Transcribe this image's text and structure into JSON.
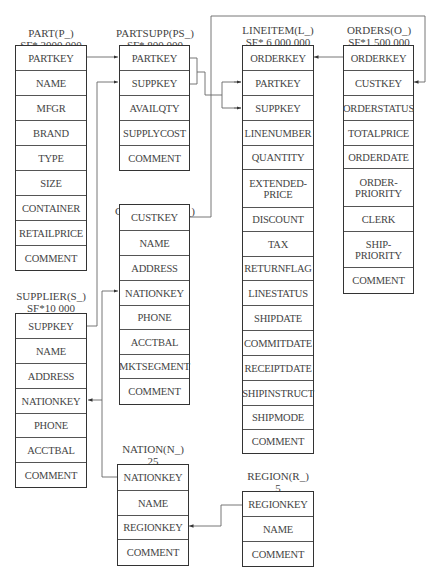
{
  "tables": {
    "part": {
      "name": "PART(P_)",
      "cardinality": "SF* 2000 000",
      "columns": [
        "PARTKEY",
        "NAME",
        "MFGR",
        "BRAND",
        "TYPE",
        "SIZE",
        "CONTAINER",
        "RETAILPRICE",
        "COMMENT"
      ]
    },
    "partsupp": {
      "name": "PARTSUPP(PS_)",
      "cardinality": "SF* 800 000",
      "columns": [
        "PARTKEY",
        "SUPPKEY",
        "AVAILQTY",
        "SUPPLYCOST",
        "COMMENT"
      ]
    },
    "lineitem": {
      "name": "LINEITEM(L_)",
      "cardinality": "SF* 6 000 000",
      "columns": [
        "ORDERKEY",
        "PARTKEY",
        "SUPPKEY",
        "LINENUMBER",
        "QUANTITY",
        "EXTENDED-\nPRICE",
        "DISCOUNT",
        "TAX",
        "RETURNFLAG",
        "LINESTATUS",
        "SHIPDATE",
        "COMMITDATE",
        "RECEIPTDATE",
        "SHIPINSTRUCT",
        "SHIPMODE",
        "COMMENT"
      ]
    },
    "orders": {
      "name": "ORDERS(O_)",
      "cardinality": "SF*1 500 000",
      "columns": [
        "ORDERKEY",
        "CUSTKEY",
        "ORDERSTATUS",
        "TOTALPRICE",
        "ORDERDATE",
        "ORDER-\nPRIORITY",
        "CLERK",
        "SHIP-\nPRIORITY",
        "COMMENT"
      ]
    },
    "customer": {
      "name": "CUSTOMER(C_)",
      "cardinality": "SF*150 000",
      "columns": [
        "CUSTKEY",
        "NAME",
        "ADDRESS",
        "NATIONKEY",
        "PHONE",
        "ACCTBAL",
        "MKTSEGMENT",
        "COMMENT"
      ]
    },
    "supplier": {
      "name": "SUPPLIER(S_)",
      "cardinality": "SF*10 000",
      "columns": [
        "SUPPKEY",
        "NAME",
        "ADDRESS",
        "NATIONKEY",
        "PHONE",
        "ACCTBAL",
        "COMMENT"
      ]
    },
    "nation": {
      "name": "NATION(N_)",
      "cardinality": "25",
      "columns": [
        "NATIONKEY",
        "NAME",
        "REGIONKEY",
        "COMMENT"
      ]
    },
    "region": {
      "name": "REGION(R_)",
      "cardinality": "5",
      "columns": [
        "REGIONKEY",
        "NAME",
        "COMMENT"
      ]
    }
  },
  "relationships": [
    {
      "from": "PART.PARTKEY",
      "to": "PARTSUPP.PARTKEY"
    },
    {
      "from": "SUPPLIER.SUPPKEY",
      "to": "PARTSUPP.SUPPKEY"
    },
    {
      "from": "PARTSUPP.PARTKEY",
      "to": "LINEITEM.PARTKEY"
    },
    {
      "from": "PARTSUPP.SUPPKEY",
      "to": "LINEITEM.SUPPKEY"
    },
    {
      "from": "ORDERS.ORDERKEY",
      "to": "LINEITEM.ORDERKEY"
    },
    {
      "from": "CUSTOMER.CUSTKEY",
      "to": "ORDERS.CUSTKEY"
    },
    {
      "from": "NATION.NATIONKEY",
      "to": "CUSTOMER.NATIONKEY"
    },
    {
      "from": "NATION.NATIONKEY",
      "to": "SUPPLIER.NATIONKEY"
    },
    {
      "from": "REGION.REGIONKEY",
      "to": "NATION.REGIONKEY"
    }
  ],
  "colors": {
    "line": "#555555",
    "border": "#333333",
    "text": "#444444"
  }
}
